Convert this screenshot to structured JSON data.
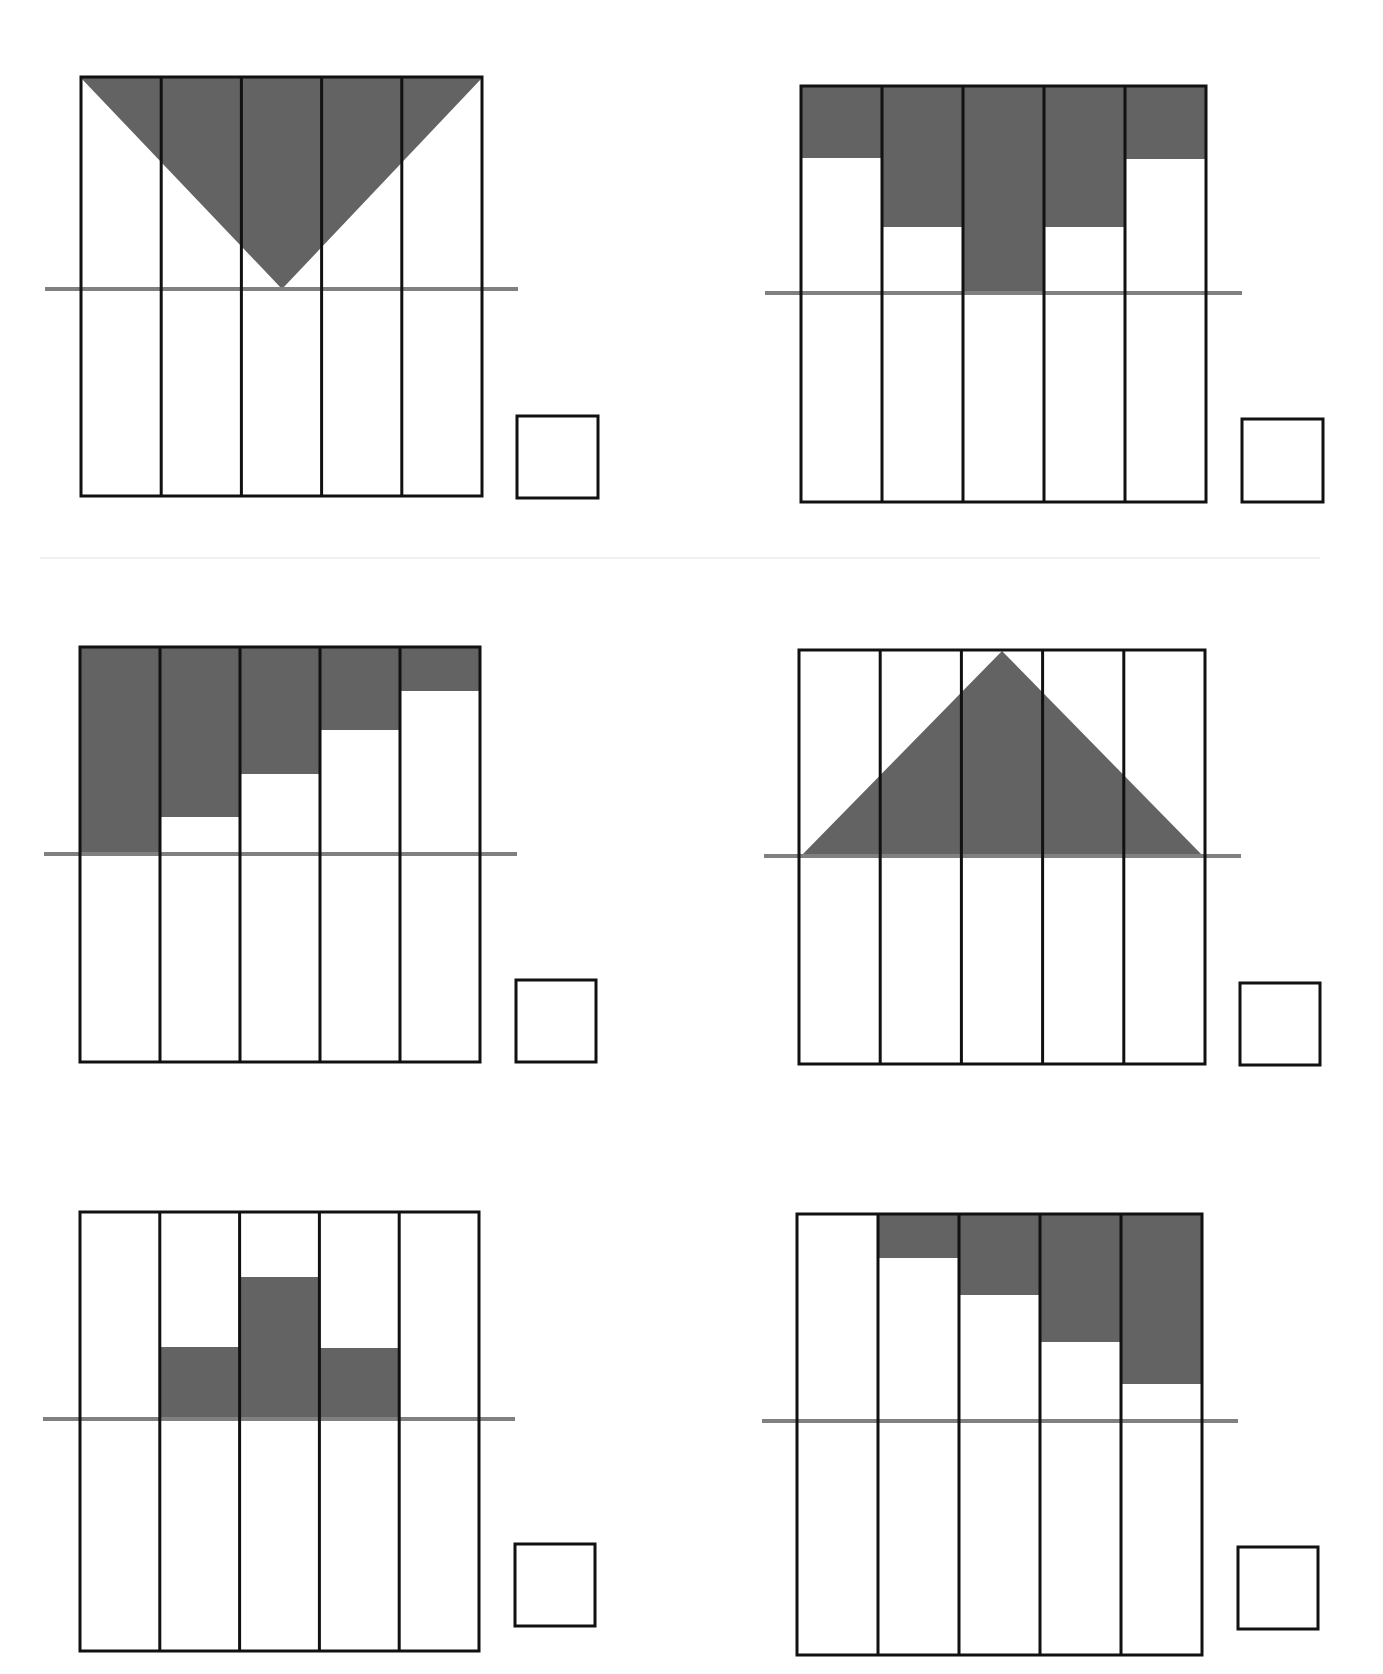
{
  "page": {
    "header_text_cropped": "",
    "colors": {
      "shade": "#636363",
      "line": "#111111",
      "baseline": "#808080",
      "background": "#ffffff"
    }
  },
  "panels": [
    {
      "id": 1,
      "shape": "inverted-triangle",
      "frame": {
        "x": 81,
        "y": 77,
        "w": 401,
        "h": 419
      },
      "columns": 5,
      "baseline": {
        "y": 289,
        "x1": 45,
        "x2": 518
      },
      "polygon": [
        [
          81,
          78
        ],
        [
          482,
          78
        ],
        [
          282,
          289
        ]
      ],
      "answer_box": {
        "x": 517,
        "y": 416,
        "w": 81,
        "h": 82
      }
    },
    {
      "id": 2,
      "shape": "column-bars-from-top",
      "frame": {
        "x": 801,
        "y": 86,
        "w": 405,
        "h": 416
      },
      "columns": 5,
      "baseline": {
        "y": 293,
        "x1": 765,
        "x2": 1242
      },
      "bar_bottoms": [
        158,
        227,
        294,
        227,
        159
      ],
      "answer_box": {
        "x": 1242,
        "y": 419,
        "w": 81,
        "h": 83
      }
    },
    {
      "id": 3,
      "shape": "column-bars-from-top",
      "frame": {
        "x": 80,
        "y": 647,
        "w": 400,
        "h": 415
      },
      "columns": 5,
      "baseline": {
        "y": 854,
        "x1": 44,
        "x2": 517
      },
      "bar_bottoms": [
        854,
        817,
        774,
        730,
        691
      ],
      "answer_box": {
        "x": 516,
        "y": 980,
        "w": 80,
        "h": 82
      }
    },
    {
      "id": 4,
      "shape": "upright-triangle",
      "frame": {
        "x": 799,
        "y": 650,
        "w": 406,
        "h": 414
      },
      "columns": 5,
      "baseline": {
        "y": 856,
        "x1": 764,
        "x2": 1241
      },
      "polygon": [
        [
          801,
          856
        ],
        [
          1002,
          651
        ],
        [
          1203,
          856
        ]
      ],
      "answer_box": {
        "x": 1240,
        "y": 983,
        "w": 80,
        "h": 82
      }
    },
    {
      "id": 5,
      "shape": "column-bars-from-baseline",
      "frame": {
        "x": 80,
        "y": 1212,
        "w": 399,
        "h": 439
      },
      "columns": 5,
      "baseline": {
        "y": 1419,
        "x1": 43,
        "x2": 515
      },
      "bar_tops": [
        null,
        1347,
        1277,
        1348,
        null
      ],
      "answer_box": {
        "x": 515,
        "y": 1544,
        "w": 80,
        "h": 82
      }
    },
    {
      "id": 6,
      "shape": "column-bars-from-top",
      "frame": {
        "x": 797,
        "y": 1214,
        "w": 405,
        "h": 441
      },
      "columns": 5,
      "baseline": {
        "y": 1421,
        "x1": 762,
        "x2": 1238
      },
      "bar_bottoms": [
        null,
        1258,
        1295,
        1342,
        1384
      ],
      "answer_box": {
        "x": 1238,
        "y": 1547,
        "w": 80,
        "h": 82
      }
    }
  ],
  "separators": [
    {
      "x": 40,
      "y": 557,
      "w": 1280
    }
  ]
}
